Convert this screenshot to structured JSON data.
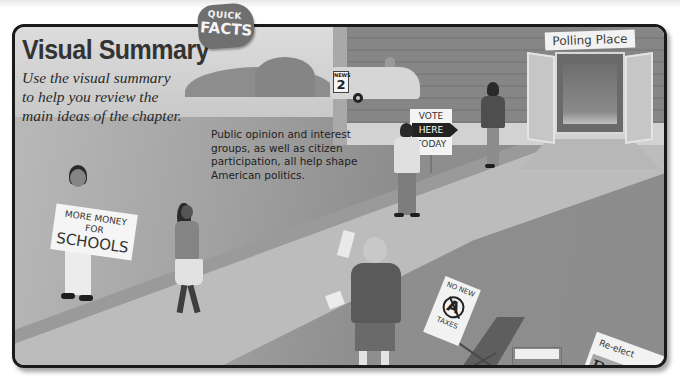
{
  "header": {
    "title": "Visual Summary",
    "badge": {
      "line1": "QUICK",
      "line2": "FACTS"
    }
  },
  "intro": "Use the visual summary to help you review the main ideas of the chapter.",
  "summary": "Public opinion and interest groups, as well as citizen participation, all help shape American politics.",
  "illustration": {
    "building_sign": "Polling Place",
    "van_label": {
      "top": "NEWS",
      "number": "2"
    },
    "vote_sign": {
      "line1": "VOTE",
      "line2": "HERE",
      "line3": "TODAY"
    },
    "school_sign": {
      "line1": "MORE MONEY",
      "line2": "FOR",
      "line3": "SCHOOLS"
    },
    "tax_sign": {
      "line1": "NO NEW",
      "symbol": "A",
      "line2": "TAXES"
    },
    "campaign_sign": {
      "line1": "Re-elect",
      "name": "Peña"
    }
  },
  "colors": {
    "frame_border": "#1a1a1a",
    "badge": "#6f6f6f",
    "title": "#333333"
  }
}
